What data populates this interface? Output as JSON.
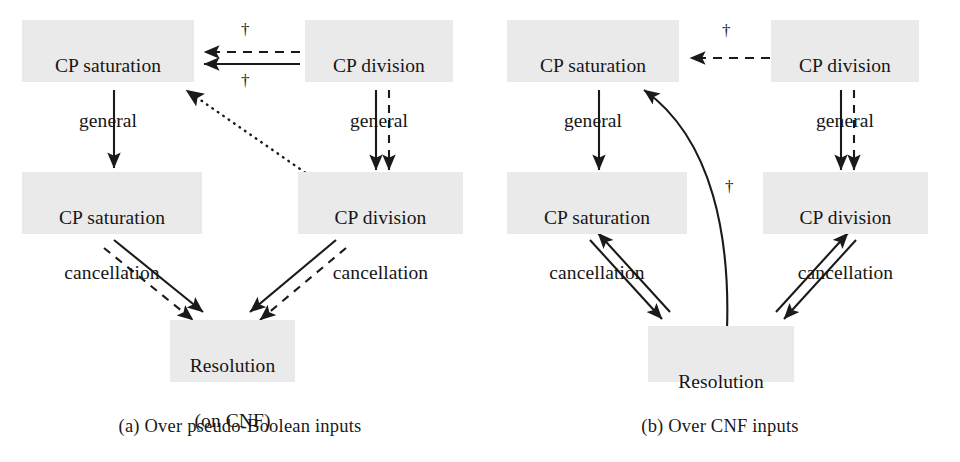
{
  "figure": {
    "background_color": "#ffffff",
    "node_fill_color": "#eaeaea",
    "ink_color": "#1a1a1a"
  },
  "panels": [
    {
      "id": "a",
      "caption": "(a) Over pseudo-Boolean inputs",
      "nodes": {
        "cp_saturation_general": {
          "line1": "CP saturation",
          "line2": "general"
        },
        "cp_division_general": {
          "line1": "CP division",
          "line2": "general"
        },
        "cp_saturation_cancellation": {
          "line1": "CP saturation",
          "line2": "cancellation"
        },
        "cp_division_cancellation": {
          "line1": "CP division",
          "line2": "cancellation"
        },
        "resolution": {
          "line1": "Resolution",
          "line2": "(on CNF)"
        }
      },
      "edge_markers": {
        "dagger_above_horizontal": "†",
        "dagger_below_horizontal": "†"
      },
      "edges": [
        {
          "name": "division-general-to-saturation-general-dashed",
          "style": "dashed",
          "direction": "left"
        },
        {
          "name": "division-general-to-saturation-general-solid",
          "style": "solid",
          "direction": "left"
        },
        {
          "name": "saturation-general-to-saturation-cancellation",
          "style": "solid",
          "direction": "down"
        },
        {
          "name": "division-general-to-division-cancellation-solid",
          "style": "solid",
          "direction": "down"
        },
        {
          "name": "division-general-to-division-cancellation-dashed",
          "style": "dashed",
          "direction": "down"
        },
        {
          "name": "division-cancellation-to-saturation-general-dotted",
          "style": "dotted",
          "direction": "up-left"
        },
        {
          "name": "saturation-cancellation-to-resolution-solid",
          "style": "solid",
          "direction": "down-right"
        },
        {
          "name": "saturation-cancellation-to-resolution-dashed",
          "style": "dashed",
          "direction": "down-right"
        },
        {
          "name": "division-cancellation-to-resolution-solid",
          "style": "solid",
          "direction": "down-left"
        },
        {
          "name": "division-cancellation-to-resolution-dashed",
          "style": "dashed",
          "direction": "down-left"
        }
      ]
    },
    {
      "id": "b",
      "caption": "(b) Over CNF inputs",
      "nodes": {
        "cp_saturation_general": {
          "line1": "CP saturation",
          "line2": "general"
        },
        "cp_division_general": {
          "line1": "CP division",
          "line2": "general"
        },
        "cp_saturation_cancellation": {
          "line1": "CP saturation",
          "line2": "cancellation"
        },
        "cp_division_cancellation": {
          "line1": "CP division",
          "line2": "cancellation"
        },
        "resolution": {
          "line1": "Resolution",
          "line2": ""
        }
      },
      "edge_markers": {
        "dagger_above_horizontal": "†",
        "dagger_beside_curve": "†"
      },
      "edges": [
        {
          "name": "division-general-to-saturation-general-dashed",
          "style": "dashed",
          "direction": "left"
        },
        {
          "name": "saturation-general-to-saturation-cancellation",
          "style": "solid",
          "direction": "down"
        },
        {
          "name": "division-general-to-division-cancellation-solid",
          "style": "solid",
          "direction": "down"
        },
        {
          "name": "division-general-to-division-cancellation-dashed",
          "style": "dashed",
          "direction": "down"
        },
        {
          "name": "resolution-to-saturation-general-curved",
          "style": "solid-curved",
          "direction": "up-left"
        },
        {
          "name": "saturation-cancellation-to-resolution",
          "style": "solid",
          "direction": "down-right"
        },
        {
          "name": "resolution-to-saturation-cancellation",
          "style": "solid",
          "direction": "up-left"
        },
        {
          "name": "division-cancellation-to-resolution",
          "style": "solid",
          "direction": "down-left"
        },
        {
          "name": "resolution-to-division-cancellation",
          "style": "solid",
          "direction": "up-right"
        }
      ]
    }
  ]
}
